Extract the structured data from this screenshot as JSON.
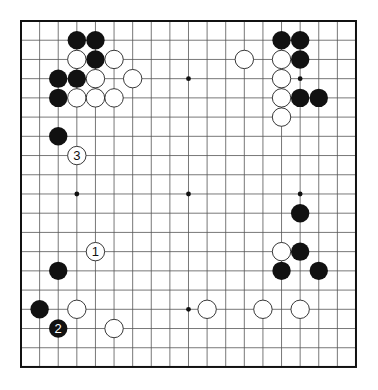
{
  "board": {
    "size": 19,
    "origin": [
      21,
      21
    ],
    "spacing": [
      18.61,
      19.22
    ],
    "stone_radius": 9.2,
    "colors": {
      "background": "#ffffff",
      "grid_line": "#555555",
      "border": "#111111",
      "black_stone": "#111111",
      "white_stone": "#ffffff",
      "white_stone_stroke": "#222222",
      "star_point": "#111111"
    },
    "star_points": [
      [
        3,
        3
      ],
      [
        9,
        3
      ],
      [
        15,
        3
      ],
      [
        3,
        9
      ],
      [
        9,
        9
      ],
      [
        15,
        9
      ],
      [
        3,
        15
      ],
      [
        9,
        15
      ],
      [
        15,
        15
      ]
    ],
    "stones": [
      {
        "color": "black",
        "col": 3,
        "row": 1
      },
      {
        "color": "black",
        "col": 4,
        "row": 1
      },
      {
        "color": "white",
        "col": 3,
        "row": 2
      },
      {
        "color": "black",
        "col": 4,
        "row": 2
      },
      {
        "color": "white",
        "col": 5,
        "row": 2
      },
      {
        "color": "black",
        "col": 2,
        "row": 3
      },
      {
        "color": "black",
        "col": 3,
        "row": 3
      },
      {
        "color": "white",
        "col": 4,
        "row": 3
      },
      {
        "color": "white",
        "col": 6,
        "row": 3
      },
      {
        "color": "black",
        "col": 2,
        "row": 4
      },
      {
        "color": "white",
        "col": 3,
        "row": 4
      },
      {
        "color": "white",
        "col": 4,
        "row": 4
      },
      {
        "color": "white",
        "col": 5,
        "row": 4
      },
      {
        "color": "black",
        "col": 2,
        "row": 6
      },
      {
        "color": "white",
        "col": 3,
        "row": 7,
        "label": "3"
      },
      {
        "color": "black",
        "col": 14,
        "row": 1
      },
      {
        "color": "black",
        "col": 15,
        "row": 1
      },
      {
        "color": "white",
        "col": 12,
        "row": 2
      },
      {
        "color": "white",
        "col": 14,
        "row": 2
      },
      {
        "color": "black",
        "col": 15,
        "row": 2
      },
      {
        "color": "white",
        "col": 14,
        "row": 3
      },
      {
        "color": "white",
        "col": 14,
        "row": 4
      },
      {
        "color": "black",
        "col": 15,
        "row": 4
      },
      {
        "color": "black",
        "col": 16,
        "row": 4
      },
      {
        "color": "white",
        "col": 14,
        "row": 5
      },
      {
        "color": "black",
        "col": 15,
        "row": 10
      },
      {
        "color": "white",
        "col": 14,
        "row": 12
      },
      {
        "color": "black",
        "col": 15,
        "row": 12
      },
      {
        "color": "black",
        "col": 14,
        "row": 13
      },
      {
        "color": "black",
        "col": 16,
        "row": 13
      },
      {
        "color": "white",
        "col": 13,
        "row": 15
      },
      {
        "color": "white",
        "col": 15,
        "row": 15
      },
      {
        "color": "white",
        "col": 4,
        "row": 12,
        "label": "1"
      },
      {
        "color": "black",
        "col": 2,
        "row": 13
      },
      {
        "color": "black",
        "col": 1,
        "row": 15
      },
      {
        "color": "white",
        "col": 3,
        "row": 15
      },
      {
        "color": "white",
        "col": 10,
        "row": 15
      },
      {
        "color": "black",
        "col": 2,
        "row": 16,
        "label": "2"
      },
      {
        "color": "white",
        "col": 5,
        "row": 16
      }
    ]
  },
  "move_labels": [
    "1",
    "2",
    "3"
  ]
}
